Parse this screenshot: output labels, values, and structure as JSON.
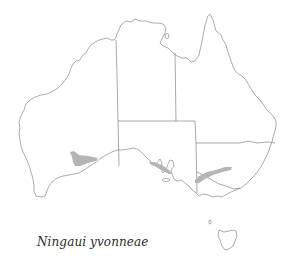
{
  "map": {
    "region": "Australia",
    "caption": "Ningaui yvonneae",
    "colors": {
      "background": "#ffffff",
      "coastline": "#8a8a8a",
      "state_borders": "#6e6e6e",
      "distribution": "#b5b5b5"
    },
    "distribution_areas": [
      {
        "name": "Western Australia range",
        "location": "southern interior WA"
      },
      {
        "name": "South Australia range",
        "location": "north of Eyre Peninsula"
      },
      {
        "name": "New South Wales range",
        "location": "western NSW / Murray region"
      }
    ]
  }
}
